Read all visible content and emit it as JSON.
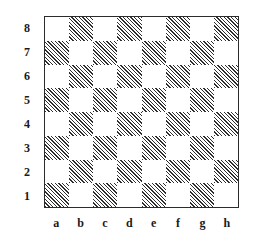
{
  "figure": {
    "name": "chessboard-diagram",
    "border_color": "#2b2b2b",
    "background_color": "#ffffff",
    "hatch_color": "#2e2e2e",
    "light_square_color": "#ffffff"
  },
  "board": {
    "files": [
      "a",
      "b",
      "c",
      "d",
      "e",
      "f",
      "g",
      "h"
    ],
    "ranks": [
      "8",
      "7",
      "6",
      "5",
      "4",
      "3",
      "2",
      "1"
    ],
    "size": 8,
    "dark_square_style": "diagonal-hatch",
    "rows": [
      [
        "light",
        "dark",
        "light",
        "dark",
        "light",
        "dark",
        "light",
        "dark"
      ],
      [
        "dark",
        "light",
        "dark",
        "light",
        "dark",
        "light",
        "dark",
        "light"
      ],
      [
        "light",
        "dark",
        "light",
        "dark",
        "light",
        "dark",
        "light",
        "dark"
      ],
      [
        "dark",
        "light",
        "dark",
        "light",
        "dark",
        "light",
        "dark",
        "light"
      ],
      [
        "light",
        "dark",
        "light",
        "dark",
        "light",
        "dark",
        "light",
        "dark"
      ],
      [
        "dark",
        "light",
        "dark",
        "light",
        "dark",
        "light",
        "dark",
        "light"
      ],
      [
        "light",
        "dark",
        "light",
        "dark",
        "light",
        "dark",
        "light",
        "dark"
      ],
      [
        "dark",
        "light",
        "dark",
        "light",
        "dark",
        "light",
        "dark",
        "light"
      ]
    ]
  }
}
